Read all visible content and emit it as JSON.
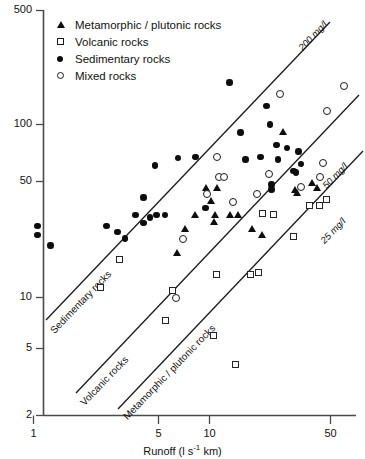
{
  "chart_data": {
    "type": "scatter",
    "title": "",
    "xlabel": "Runoff (l s-1 km)",
    "xlabel_parts": {
      "pre": "Runoff (l s",
      "sup": "-1",
      "post": " km)"
    },
    "ylabel": "",
    "xscale": "log",
    "yscale": "log",
    "xlim": [
      1,
      70
    ],
    "ylim": [
      2,
      500
    ],
    "grid": false,
    "legend_position": "top-left",
    "xticks": [
      1,
      5,
      10,
      50
    ],
    "xtick_labels": [
      "1",
      "5",
      "10",
      "50"
    ],
    "yticks": [
      2,
      5,
      10,
      50,
      100,
      500
    ],
    "ytick_labels": [
      "2",
      "5",
      "10",
      "50",
      "100",
      "500"
    ],
    "legend": [
      {
        "label": "Metamorphic / plutonic rocks",
        "marker": "filled-triangle",
        "key": "metamorphic"
      },
      {
        "label": "Volcanic rocks",
        "marker": "open-square",
        "key": "volcanic"
      },
      {
        "label": "Sedimentary rocks",
        "marker": "filled-circle",
        "key": "sedimentary"
      },
      {
        "label": "Mixed rocks",
        "marker": "open-circle",
        "key": "mixed"
      }
    ],
    "reference_lines": [
      {
        "label": "200 mg/l",
        "concentration": 200,
        "units": "mg/l"
      },
      {
        "label": "50 mg/l",
        "concentration": 50,
        "units": "mg/l"
      },
      {
        "label": "25 mg/l",
        "concentration": 25,
        "units": "mg/l"
      }
    ],
    "line_annotations": [
      {
        "label": "Sedimentary rocks",
        "on_line": "200 mg/l"
      },
      {
        "label": "Volcanic rocks",
        "on_line": "50 mg/l"
      },
      {
        "label": "Metamorphic / plutonic rocks",
        "on_line": "25 mg/l"
      }
    ],
    "series": [
      {
        "name": "Sedimentary rocks",
        "marker": "filled-circle",
        "points": [
          [
            1.05,
            26
          ],
          [
            1.05,
            23
          ],
          [
            1.25,
            20
          ],
          [
            2.6,
            26
          ],
          [
            3.0,
            24
          ],
          [
            3.3,
            22
          ],
          [
            3.8,
            30
          ],
          [
            4.2,
            27
          ],
          [
            4.6,
            29
          ],
          [
            4.2,
            38
          ],
          [
            4.9,
            58
          ],
          [
            5.0,
            30
          ],
          [
            5.6,
            30
          ],
          [
            6.6,
            64
          ],
          [
            8.3,
            65
          ],
          [
            9.5,
            33
          ],
          [
            13.0,
            175
          ],
          [
            15.0,
            90
          ],
          [
            16.0,
            63
          ],
          [
            19.5,
            65
          ],
          [
            21.0,
            128
          ],
          [
            22.0,
            100
          ],
          [
            24.0,
            76
          ],
          [
            22.5,
            45
          ],
          [
            22.5,
            42
          ],
          [
            24.5,
            63
          ],
          [
            27.5,
            73
          ],
          [
            30.0,
            54
          ],
          [
            31.0,
            53
          ],
          [
            32.0,
            70
          ],
          [
            33.0,
            59
          ]
        ]
      },
      {
        "name": "Volcanic rocks",
        "marker": "open-square",
        "points": [
          [
            2.4,
            11.5
          ],
          [
            3.1,
            16.5
          ],
          [
            5.6,
            7.4
          ],
          [
            6.2,
            11.0
          ],
          [
            10.5,
            6.0
          ],
          [
            11.0,
            13.5
          ],
          [
            14.0,
            4.1
          ],
          [
            17.0,
            13.5
          ],
          [
            19.0,
            14.0
          ],
          [
            20.0,
            30.5
          ],
          [
            23.0,
            30.0
          ],
          [
            30.0,
            22.5
          ],
          [
            37.0,
            34.0
          ],
          [
            42.0,
            34.0
          ],
          [
            46.0,
            37.0
          ]
        ]
      },
      {
        "name": "Metamorphic / plutonic rocks",
        "marker": "filled-triangle",
        "points": [
          [
            6.5,
            18.0
          ],
          [
            7.3,
            25.0
          ],
          [
            8.3,
            30.0
          ],
          [
            9.6,
            43.0
          ],
          [
            10.2,
            36.0
          ],
          [
            10.8,
            30.0
          ],
          [
            11.0,
            43.0
          ],
          [
            10.6,
            27.5
          ],
          [
            13.0,
            30.0
          ],
          [
            14.5,
            30.0
          ],
          [
            17.5,
            25.0
          ],
          [
            20.0,
            23.0
          ],
          [
            26.0,
            90.0
          ],
          [
            30.5,
            42.0
          ],
          [
            31.5,
            40.0
          ],
          [
            38.0,
            46.0
          ],
          [
            41.0,
            43.0
          ]
        ]
      },
      {
        "name": "Mixed rocks",
        "marker": "open-circle",
        "points": [
          [
            6.4,
            10.0
          ],
          [
            7.0,
            22.0
          ],
          [
            9.6,
            40.0
          ],
          [
            11.0,
            65.0
          ],
          [
            11.3,
            50.0
          ],
          [
            12.0,
            50.0
          ],
          [
            13.5,
            36.0
          ],
          [
            18.5,
            40.0
          ],
          [
            21.5,
            52.0
          ],
          [
            25.0,
            152.0
          ],
          [
            33.0,
            44.0
          ],
          [
            42.0,
            50.0
          ],
          [
            44.0,
            60.0
          ],
          [
            46.0,
            120.0
          ],
          [
            58.0,
            168.0
          ]
        ]
      }
    ]
  }
}
